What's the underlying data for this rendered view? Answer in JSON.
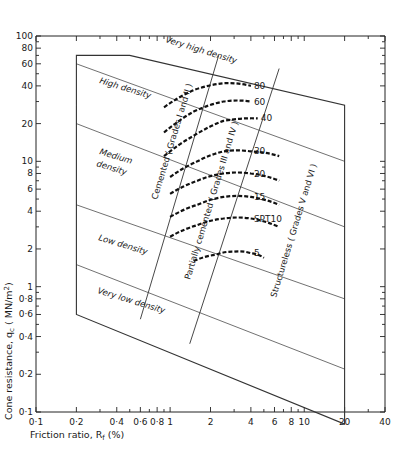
{
  "chart_data": {
    "type": "line",
    "title": "",
    "xlabel": "Friction ratio, R_f (%)",
    "ylabel": "Cone resistance, q_c (MN/m²)",
    "xscale": "log",
    "yscale": "log",
    "xlim": [
      0.1,
      40
    ],
    "ylim": [
      0.1,
      100
    ],
    "grid": false,
    "x_ticks": [
      "0.1",
      "0.2",
      "0.4",
      "0.6",
      "0.8",
      "1",
      "2",
      "4",
      "6",
      "8",
      "10",
      "20",
      "40"
    ],
    "y_ticks": [
      "0.1",
      "0.2",
      "0.4",
      "0.6",
      "0.8",
      "1",
      "2",
      "4",
      "6",
      "8",
      "10",
      "20",
      "40",
      "60",
      "80",
      "100"
    ],
    "density_zones": [
      {
        "name": "Very high density"
      },
      {
        "name": "High density"
      },
      {
        "name": "Medium density"
      },
      {
        "name": "Low density"
      },
      {
        "name": "Very low density"
      }
    ],
    "cementation_zones": [
      {
        "name": "Cemented ( Grades I and II )"
      },
      {
        "name": "Partially cemented ( Grades III and IV )"
      },
      {
        "name": "Structureless ( Grades V and VI )"
      }
    ],
    "series": [
      {
        "name": "80",
        "label": "80",
        "points": [
          [
            0.9,
            27
          ],
          [
            1.5,
            37
          ],
          [
            2.5,
            42
          ],
          [
            4.0,
            40
          ]
        ]
      },
      {
        "name": "60",
        "label": "60",
        "points": [
          [
            0.9,
            17
          ],
          [
            1.5,
            25
          ],
          [
            2.5,
            30
          ],
          [
            4.0,
            30
          ]
        ]
      },
      {
        "name": "40",
        "label": "40",
        "points": [
          [
            0.9,
            11
          ],
          [
            1.5,
            16
          ],
          [
            2.5,
            21
          ],
          [
            4.5,
            22
          ]
        ]
      },
      {
        "name": "30",
        "label": "30",
        "points": [
          [
            1.0,
            7.5
          ],
          [
            1.6,
            10
          ],
          [
            2.5,
            12
          ],
          [
            4.0,
            12
          ],
          [
            6.5,
            11
          ]
        ]
      },
      {
        "name": "20",
        "label": "20",
        "points": [
          [
            1.0,
            5.5
          ],
          [
            1.6,
            7
          ],
          [
            2.5,
            8
          ],
          [
            4.0,
            8
          ],
          [
            6.5,
            7
          ]
        ]
      },
      {
        "name": "15",
        "label": "15",
        "points": [
          [
            1.0,
            3.6
          ],
          [
            1.6,
            4.5
          ],
          [
            2.5,
            5.2
          ],
          [
            4.0,
            5.2
          ],
          [
            6.5,
            4.5
          ]
        ]
      },
      {
        "name": "SPT 10",
        "label": "SPT10",
        "points": [
          [
            1.0,
            2.5
          ],
          [
            1.6,
            3.1
          ],
          [
            2.5,
            3.5
          ],
          [
            4.0,
            3.5
          ],
          [
            6.5,
            3.0
          ]
        ]
      },
      {
        "name": "5",
        "label": "5",
        "points": [
          [
            1.5,
            1.6
          ],
          [
            2.2,
            1.8
          ],
          [
            3.0,
            1.9
          ],
          [
            4.0,
            1.85
          ],
          [
            5.0,
            1.7
          ]
        ]
      }
    ],
    "boundary_polygon": [
      [
        0.2,
        70
      ],
      [
        0.5,
        70
      ],
      [
        20,
        28
      ],
      [
        20,
        0.08
      ],
      [
        0.2,
        0.6
      ]
    ],
    "density_boundaries": [
      {
        "from": [
          0.2,
          60
        ],
        "to": [
          20,
          10
        ]
      },
      {
        "from": [
          0.2,
          20
        ],
        "to": [
          20,
          3
        ]
      },
      {
        "from": [
          0.2,
          4.5
        ],
        "to": [
          20,
          0.8
        ]
      },
      {
        "from": [
          0.2,
          1.5
        ],
        "to": [
          20,
          0.22
        ]
      }
    ],
    "cementation_boundaries": [
      {
        "from": [
          0.6,
          0.55
        ],
        "to": [
          2.3,
          70
        ]
      },
      {
        "from": [
          1.4,
          0.35
        ],
        "to": [
          6.5,
          55
        ]
      }
    ]
  },
  "labels": {
    "y_axis_title": "Cone resistance, q",
    "y_axis_sub": "c",
    "y_axis_units": " ( MN/m",
    "y_axis_sup": "2",
    "y_axis_close": ")",
    "x_axis_title": "Friction ratio, R",
    "x_axis_sub": "f",
    "x_axis_units": " (%)",
    "zone_very_high": "Very high density",
    "zone_high": "High density",
    "zone_medium_1": "Medium",
    "zone_medium_2": "density",
    "zone_low": "Low density",
    "zone_very_low": "Very low density",
    "cemented": "Cemented ( Grades I and II )",
    "partially_cemented": "Partially cemented ( Grades III and IV )",
    "structureless": "Structureless ( Grades V and VI )"
  }
}
